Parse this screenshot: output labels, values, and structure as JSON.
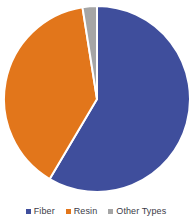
{
  "chart_data": {
    "type": "pie",
    "title": "",
    "subtitle": "",
    "xlabel": "",
    "ylabel": "",
    "grid": false,
    "legend_position": "bottom",
    "categories": [
      "Fiber",
      "Resin",
      "Other Types"
    ],
    "values": [
      58.5,
      39.0,
      2.5
    ],
    "units": "percent",
    "start_angle_deg": 0,
    "direction": "clockwise",
    "slices": [
      {
        "label": "Fiber",
        "value": 58.5,
        "color": "#3f4e9c",
        "start_angle_deg": 0,
        "end_angle_deg": 210.6
      },
      {
        "label": "Resin",
        "value": 39.0,
        "color": "#e2761b",
        "start_angle_deg": 210.6,
        "end_angle_deg": 351.0
      },
      {
        "label": "Other Types",
        "value": 2.5,
        "color": "#a5a5a5",
        "start_angle_deg": 351.0,
        "end_angle_deg": 360.0
      }
    ],
    "colors": {
      "fiber": "#3f4e9c",
      "resin": "#e2761b",
      "other_types": "#a5a5a5",
      "slice_border": "#ffffff",
      "background": "#ffffff",
      "legend_text": "#3b3b47"
    },
    "geometry": {
      "center_x": 97,
      "center_y": 99,
      "radius": 93
    }
  },
  "legend": {
    "items": [
      {
        "label": "Fiber",
        "color": "#3f4e9c"
      },
      {
        "label": "Resin",
        "color": "#e2761b"
      },
      {
        "label": "Other Types",
        "color": "#a5a5a5"
      }
    ]
  }
}
